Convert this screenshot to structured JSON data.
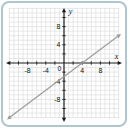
{
  "panel": {
    "border_color": "#adc6d2",
    "background": "#ffffff"
  },
  "chart_data": {
    "type": "line",
    "title": "",
    "equation": "y = (3/4)x - 3",
    "slope": 0.75,
    "y_intercept": -3,
    "x_intercept": 4,
    "line_points": [
      {
        "x": -12,
        "y": -12
      },
      {
        "x": 12,
        "y": 6
      }
    ],
    "line_has_arrows": true,
    "axes": {
      "x_label": "x",
      "y_label": "y",
      "x_range": [
        -12,
        12
      ],
      "y_range": [
        -12,
        12
      ],
      "grid": true,
      "grid_step": 1,
      "tick_step": 2,
      "x_tick_labels": [
        {
          "value": -8,
          "text": "-8"
        },
        {
          "value": -4,
          "text": "-4"
        },
        {
          "value": 4,
          "text": "4"
        },
        {
          "value": 8,
          "text": "8"
        }
      ],
      "y_tick_labels": [
        {
          "value": 8,
          "text": "8"
        },
        {
          "value": 4,
          "text": "4"
        },
        {
          "value": -4,
          "text": "-4"
        },
        {
          "value": -8,
          "text": "-8"
        }
      ],
      "origin_label": "0"
    },
    "colors": {
      "grid": "#dedede",
      "axis": "#1c1c1c",
      "line": "#9c9c9c",
      "text": "#111111"
    }
  }
}
